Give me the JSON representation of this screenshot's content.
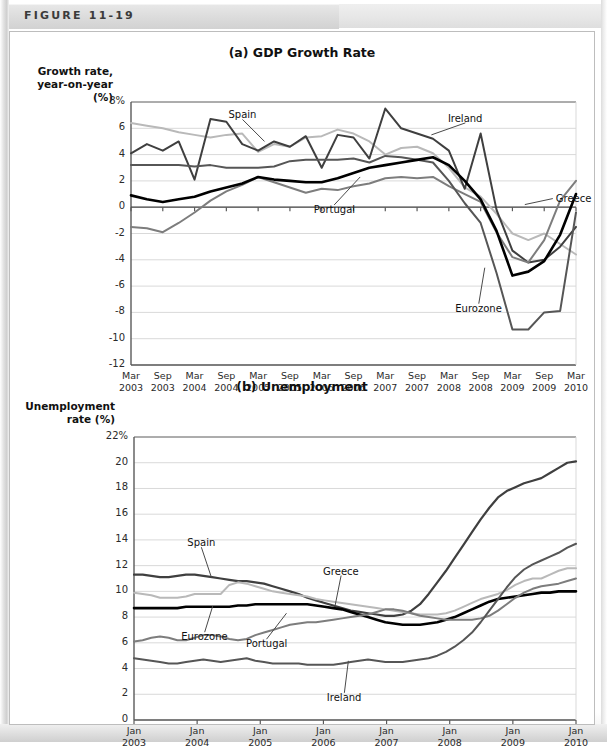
{
  "figure": {
    "label": "FIGURE 11-19"
  },
  "colors": {
    "greece": "#b9b9b9",
    "spain": "#3f3f3f",
    "portugal": "#7d7d7d",
    "ireland": "#565656",
    "eurozone": "#000000",
    "grid": "#d9d9d9",
    "axis": "#5a5a5a",
    "zero_line": "#444444"
  },
  "chart_data": [
    {
      "id": "gdp",
      "type": "line",
      "title": "(a) GDP Growth Rate",
      "ylabel": "Growth rate,\nyear-on-year\n(%)",
      "ylabel_lines": [
        "Growth rate,",
        "year-on-year",
        "(%)"
      ],
      "xlabel": "",
      "ylim": [
        -12,
        8
      ],
      "yticks": [
        8,
        6,
        4,
        2,
        0,
        -2,
        -4,
        -6,
        -8,
        -10,
        -12
      ],
      "ytick_labels": [
        "8%",
        "6",
        "4",
        "2",
        "0",
        "-2",
        "-4",
        "-6",
        "-8",
        "-10",
        "-12"
      ],
      "grid": true,
      "x": [
        "Mar 2003",
        "Jun 2003",
        "Sep 2003",
        "Dec 2003",
        "Mar 2004",
        "Jun 2004",
        "Sep 2004",
        "Dec 2004",
        "Mar 2005",
        "Jun 2005",
        "Sep 2005",
        "Dec 2005",
        "Mar 2006",
        "Jun 2006",
        "Sep 2006",
        "Dec 2006",
        "Mar 2007",
        "Jun 2007",
        "Sep 2007",
        "Dec 2007",
        "Mar 2008",
        "Jun 2008",
        "Sep 2008",
        "Dec 2008",
        "Mar 2009",
        "Jun 2009",
        "Sep 2009",
        "Dec 2009",
        "Mar 2010"
      ],
      "xticks": [
        {
          "line1": "Mar",
          "line2": "2003"
        },
        {
          "line1": "Sep",
          "line2": "2003"
        },
        {
          "line1": "Mar",
          "line2": "2004"
        },
        {
          "line1": "Sep",
          "line2": "2004"
        },
        {
          "line1": "Mar",
          "line2": "2005"
        },
        {
          "line1": "Sep",
          "line2": "2005"
        },
        {
          "line1": "Mar",
          "line2": "2006"
        },
        {
          "line1": "Sep",
          "line2": "2006"
        },
        {
          "line1": "Mar",
          "line2": "2007"
        },
        {
          "line1": "Sep",
          "line2": "2007"
        },
        {
          "line1": "Mar",
          "line2": "2008"
        },
        {
          "line1": "Sep",
          "line2": "2008"
        },
        {
          "line1": "Mar",
          "line2": "2009"
        },
        {
          "line1": "Sep",
          "line2": "2009"
        },
        {
          "line1": "Mar",
          "line2": "2010"
        }
      ],
      "series": [
        {
          "name": "Greece",
          "color_key": "greece",
          "width": 2.0,
          "values": [
            6.4,
            6.2,
            6.0,
            5.7,
            5.5,
            5.3,
            5.5,
            5.6,
            4.2,
            4.8,
            4.6,
            5.3,
            5.4,
            5.9,
            5.6,
            5.0,
            4.0,
            4.5,
            4.6,
            4.1,
            3.0,
            1.5,
            0.8,
            -0.5,
            -2.0,
            -2.5,
            -2.0,
            -2.8,
            -3.6
          ]
        },
        {
          "name": "Spain",
          "color_key": "spain",
          "width": 2.0,
          "values": [
            4.1,
            4.8,
            4.3,
            5.0,
            2.1,
            6.7,
            6.5,
            4.8,
            4.3,
            5.0,
            4.6,
            5.4,
            3.0,
            5.5,
            5.3,
            3.7,
            7.5,
            6.0,
            5.6,
            5.2,
            4.3,
            1.4,
            5.6,
            -0.2,
            -3.3,
            -4.2,
            -4.0,
            -3.0,
            -1.5
          ]
        },
        {
          "name": "Portugal",
          "color_key": "portugal",
          "width": 2.0,
          "values": [
            -1.5,
            -1.6,
            -1.9,
            -1.2,
            -0.4,
            0.5,
            1.2,
            1.7,
            2.3,
            1.9,
            1.5,
            1.1,
            1.4,
            1.3,
            1.6,
            1.8,
            2.2,
            2.3,
            2.2,
            2.3,
            1.6,
            1.0,
            0.4,
            -1.9,
            -3.8,
            -4.2,
            -2.5,
            0.5,
            2.0
          ]
        },
        {
          "name": "Ireland",
          "color_key": "ireland",
          "width": 2.0,
          "values": [
            3.2,
            3.2,
            3.2,
            3.2,
            3.1,
            3.2,
            3.0,
            3.0,
            3.0,
            3.1,
            3.5,
            3.6,
            3.6,
            3.6,
            3.7,
            3.4,
            3.9,
            3.8,
            3.6,
            3.4,
            2.0,
            0.3,
            -1.2,
            -5.0,
            -9.3,
            -9.3,
            -8.0,
            -7.9,
            -0.4
          ]
        },
        {
          "name": "Eurozone",
          "color_key": "eurozone",
          "width": 2.6,
          "values": [
            0.9,
            0.6,
            0.4,
            0.6,
            0.8,
            1.2,
            1.5,
            1.8,
            2.3,
            2.1,
            2.0,
            1.9,
            1.9,
            2.2,
            2.6,
            3.0,
            3.2,
            3.4,
            3.6,
            3.8,
            3.2,
            2.0,
            0.6,
            -1.8,
            -5.2,
            -4.9,
            -4.1,
            -2.1,
            1.0
          ]
        }
      ],
      "annotations": [
        {
          "name": "Spain",
          "x_frac": 0.3,
          "y_value": 5.0,
          "label_dx": -22,
          "label_dy": -22
        },
        {
          "name": "Portugal",
          "x_frac": 0.515,
          "y_value": 2.3,
          "label_dx": -26,
          "label_dy": 28
        },
        {
          "name": "Ireland",
          "x_frac": 0.675,
          "y_value": 5.5,
          "label_dx": 34,
          "label_dy": -12
        },
        {
          "name": "Greece",
          "x_frac": 0.885,
          "y_value": 0.2,
          "label_dx": 28,
          "label_dy": -6
        },
        {
          "name": "Eurozone",
          "x_frac": 0.795,
          "y_value": -4.6,
          "label_dx": -6,
          "label_dy": 36
        }
      ]
    },
    {
      "id": "unemployment",
      "type": "line",
      "title": "(b) Unemployment",
      "ylabel_lines": [
        "Unemployment",
        "rate (%)"
      ],
      "xlabel": "",
      "ylim": [
        0,
        22
      ],
      "yticks": [
        22,
        20,
        18,
        16,
        14,
        12,
        10,
        8,
        6,
        4,
        2,
        0
      ],
      "ytick_labels": [
        "22%",
        "20",
        "18",
        "16",
        "14",
        "12",
        "10",
        "8",
        "6",
        "4",
        "2",
        "0"
      ],
      "grid": true,
      "xticks": [
        {
          "line1": "Jan",
          "line2": "2003"
        },
        {
          "line1": "Jan",
          "line2": "2004"
        },
        {
          "line1": "Jan",
          "line2": "2005"
        },
        {
          "line1": "Jan",
          "line2": "2006"
        },
        {
          "line1": "Jan",
          "line2": "2007"
        },
        {
          "line1": "Jan",
          "line2": "2008"
        },
        {
          "line1": "Jan",
          "line2": "2009"
        },
        {
          "line1": "Jan",
          "line2": "2010"
        }
      ],
      "series": [
        {
          "name": "Spain",
          "color_key": "spain",
          "width": 2.2,
          "values": [
            11.3,
            11.3,
            11.2,
            11.1,
            11.1,
            11.2,
            11.3,
            11.3,
            11.2,
            11.1,
            11.0,
            10.9,
            10.8,
            10.8,
            10.7,
            10.6,
            10.4,
            10.2,
            10.0,
            9.8,
            9.5,
            9.3,
            9.1,
            8.9,
            8.7,
            8.5,
            8.4,
            8.3,
            8.2,
            8.1,
            8.1,
            8.2,
            8.5,
            9.0,
            9.8,
            10.7,
            11.6,
            12.6,
            13.6,
            14.6,
            15.6,
            16.5,
            17.3,
            17.8,
            18.1,
            18.4,
            18.6,
            18.8,
            19.2,
            19.6,
            20.0,
            20.1
          ]
        },
        {
          "name": "Greece",
          "color_key": "greece",
          "width": 2.0,
          "values": [
            9.9,
            9.8,
            9.7,
            9.5,
            9.5,
            9.5,
            9.6,
            9.8,
            9.8,
            9.8,
            9.8,
            10.5,
            10.7,
            10.6,
            10.4,
            10.2,
            10.0,
            9.9,
            9.8,
            9.7,
            9.6,
            9.4,
            9.3,
            9.2,
            9.1,
            9.0,
            8.9,
            8.8,
            8.7,
            8.6,
            8.5,
            8.4,
            8.3,
            8.2,
            8.2,
            8.2,
            8.3,
            8.5,
            8.8,
            9.1,
            9.4,
            9.6,
            9.8,
            10.1,
            10.5,
            10.8,
            11.0,
            11.0,
            11.3,
            11.6,
            11.8,
            11.8
          ]
        },
        {
          "name": "Eurozone",
          "color_key": "eurozone",
          "width": 2.6,
          "values": [
            8.7,
            8.7,
            8.7,
            8.7,
            8.7,
            8.7,
            8.8,
            8.8,
            8.8,
            8.8,
            8.8,
            8.8,
            8.9,
            8.9,
            9.0,
            9.0,
            9.0,
            9.0,
            9.0,
            9.0,
            9.0,
            8.9,
            8.8,
            8.7,
            8.6,
            8.4,
            8.2,
            8.0,
            7.8,
            7.6,
            7.5,
            7.4,
            7.4,
            7.4,
            7.5,
            7.6,
            7.8,
            8.0,
            8.3,
            8.6,
            8.9,
            9.2,
            9.4,
            9.5,
            9.6,
            9.7,
            9.8,
            9.9,
            9.9,
            10.0,
            10.0,
            10.0
          ]
        },
        {
          "name": "Portugal",
          "color_key": "portugal",
          "width": 2.0,
          "values": [
            6.1,
            6.2,
            6.4,
            6.5,
            6.4,
            6.2,
            6.2,
            6.4,
            6.6,
            6.6,
            6.5,
            6.3,
            6.2,
            6.3,
            6.6,
            6.8,
            7.0,
            7.2,
            7.4,
            7.5,
            7.6,
            7.6,
            7.7,
            7.8,
            7.9,
            8.0,
            8.1,
            8.2,
            8.4,
            8.6,
            8.6,
            8.5,
            8.3,
            8.1,
            8.0,
            7.9,
            7.8,
            7.8,
            7.8,
            7.8,
            7.9,
            8.1,
            8.5,
            9.0,
            9.5,
            9.9,
            10.2,
            10.4,
            10.5,
            10.6,
            10.8,
            11.0
          ]
        },
        {
          "name": "Ireland",
          "color_key": "ireland",
          "width": 2.0,
          "values": [
            4.8,
            4.7,
            4.6,
            4.5,
            4.4,
            4.4,
            4.5,
            4.6,
            4.7,
            4.6,
            4.5,
            4.6,
            4.7,
            4.8,
            4.6,
            4.5,
            4.4,
            4.4,
            4.4,
            4.4,
            4.3,
            4.3,
            4.3,
            4.3,
            4.4,
            4.5,
            4.6,
            4.7,
            4.6,
            4.5,
            4.5,
            4.5,
            4.6,
            4.7,
            4.8,
            5.0,
            5.3,
            5.7,
            6.2,
            6.8,
            7.6,
            8.5,
            9.4,
            10.3,
            11.1,
            11.7,
            12.1,
            12.4,
            12.7,
            13.0,
            13.4,
            13.7
          ]
        },
        {
          "name": "SpainTail",
          "color_key": "spain",
          "width": 0,
          "values": []
        }
      ],
      "annotations": [
        {
          "name": "Spain",
          "x_frac": 0.175,
          "y_value": 11.1,
          "label_dx": -10,
          "label_dy": -30
        },
        {
          "name": "Eurozone",
          "x_frac": 0.178,
          "y_value": 8.85,
          "label_dx": -8,
          "label_dy": 26
        },
        {
          "name": "Greece",
          "x_frac": 0.455,
          "y_value": 8.9,
          "label_dx": 6,
          "label_dy": -30
        },
        {
          "name": "Portugal",
          "x_frac": 0.345,
          "y_value": 8.3,
          "label_dx": -20,
          "label_dy": 26
        },
        {
          "name": "Ireland",
          "x_frac": 0.485,
          "y_value": 4.6,
          "label_dx": -4,
          "label_dy": 32
        }
      ]
    }
  ]
}
